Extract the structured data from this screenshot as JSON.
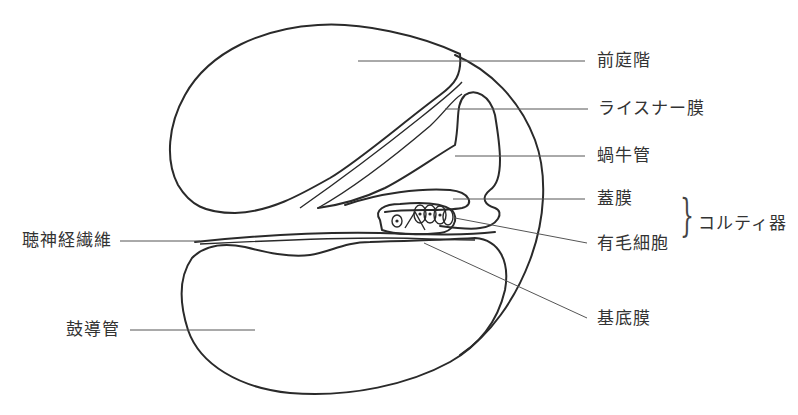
{
  "diagram": {
    "labels": {
      "scala_vestibuli": "前庭階",
      "reissner_membrane": "ライスナー膜",
      "cochlear_duct": "蝸牛管",
      "tectorial_membrane": "蓋膜",
      "hair_cells": "有毛細胞",
      "organ_of_corti": "コルティ器",
      "auditory_nerve_fibers": "聴神経繊維",
      "scala_tympani": "鼓導管",
      "basilar_membrane": "基底膜"
    },
    "bracket_glyph": "}",
    "colors": {
      "stroke": "#2a2a2a",
      "leader": "#555555",
      "text": "#333333",
      "background": "#ffffff"
    }
  }
}
